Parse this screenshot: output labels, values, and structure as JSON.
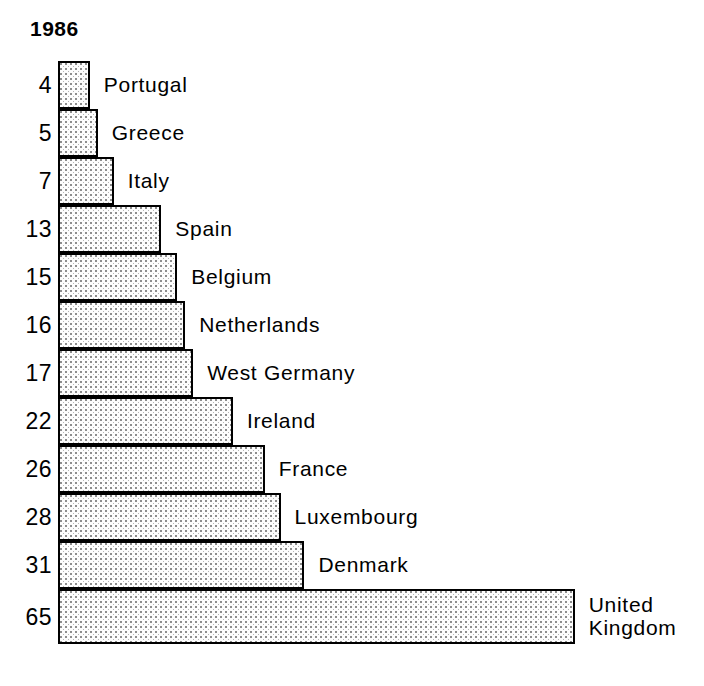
{
  "chart_data": {
    "type": "bar",
    "orientation": "horizontal",
    "title": "1986",
    "xlabel": "",
    "ylabel": "",
    "grid": false,
    "legend": "none",
    "axis_visible": false,
    "value_label_position": "left-of-bar",
    "category_label_position": "right-of-bar",
    "xlim": [
      0,
      65
    ],
    "categories": [
      "Portugal",
      "Greece",
      "Italy",
      "Spain",
      "Belgium",
      "Netherlands",
      "West Germany",
      "Ireland",
      "France",
      "Luxembourg",
      "Denmark",
      "United\nKingdom"
    ],
    "values": [
      4,
      5,
      7,
      13,
      15,
      16,
      17,
      22,
      26,
      28,
      31,
      65
    ],
    "bars": [
      {
        "label": "Portugal",
        "value": 4,
        "value_text": "4"
      },
      {
        "label": "Greece",
        "value": 5,
        "value_text": "5"
      },
      {
        "label": "Italy",
        "value": 7,
        "value_text": "7"
      },
      {
        "label": "Spain",
        "value": 13,
        "value_text": "13"
      },
      {
        "label": "Belgium",
        "value": 15,
        "value_text": "15"
      },
      {
        "label": "Netherlands",
        "value": 16,
        "value_text": "16"
      },
      {
        "label": "West Germany",
        "value": 17,
        "value_text": "17"
      },
      {
        "label": "Ireland",
        "value": 22,
        "value_text": "22"
      },
      {
        "label": "France",
        "value": 26,
        "value_text": "26"
      },
      {
        "label": "Luxembourg",
        "value": 28,
        "value_text": "28"
      },
      {
        "label": "Denmark",
        "value": 31,
        "value_text": "31"
      },
      {
        "label": "United\nKingdom",
        "value": 65,
        "value_text": "65"
      }
    ],
    "colors": {
      "bar_outline": "#000000",
      "bar_fill": "#fdfdfd",
      "bar_pattern_dots": "#8d8d8d",
      "text": "#000000",
      "background": "#ffffff"
    }
  },
  "layout": {
    "bar_origin_x": 58,
    "pixels_per_unit": 7.95,
    "row_height": 48,
    "last_row_height": 55,
    "label_gap": 14
  }
}
